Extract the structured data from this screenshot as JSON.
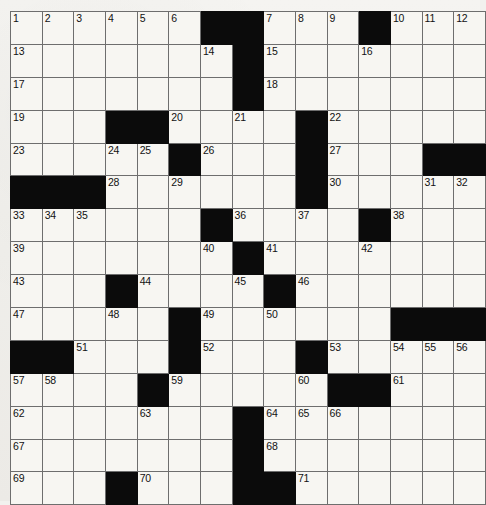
{
  "puzzle": {
    "type": "crossword-grid",
    "rows": 15,
    "cols": 15,
    "black_color": "#0b0b0b",
    "cell_color": "#f7f6f2",
    "grid_line_color": "#6e6e6e",
    "border_color": "#3a3a3a",
    "page_background": "#f2f1ee",
    "highest_number": 71,
    "black_cells": [
      [
        1,
        7
      ],
      [
        1,
        8
      ],
      [
        1,
        12
      ],
      [
        2,
        8
      ],
      [
        3,
        8
      ],
      [
        4,
        4
      ],
      [
        4,
        5
      ],
      [
        4,
        10
      ],
      [
        5,
        6
      ],
      [
        5,
        10
      ],
      [
        5,
        14
      ],
      [
        5,
        15
      ],
      [
        6,
        1
      ],
      [
        6,
        2
      ],
      [
        6,
        3
      ],
      [
        6,
        10
      ],
      [
        7,
        7
      ],
      [
        7,
        12
      ],
      [
        8,
        8
      ],
      [
        9,
        4
      ],
      [
        9,
        9
      ],
      [
        10,
        6
      ],
      [
        10,
        13
      ],
      [
        10,
        14
      ],
      [
        10,
        15
      ],
      [
        11,
        1
      ],
      [
        11,
        2
      ],
      [
        11,
        6
      ],
      [
        11,
        10
      ],
      [
        12,
        5
      ],
      [
        12,
        11
      ],
      [
        12,
        12
      ],
      [
        13,
        8
      ],
      [
        14,
        8
      ],
      [
        15,
        4
      ],
      [
        15,
        8
      ],
      [
        15,
        9
      ]
    ],
    "numbers": [
      {
        "row": 1,
        "col": 1,
        "n": "1"
      },
      {
        "row": 1,
        "col": 2,
        "n": "2"
      },
      {
        "row": 1,
        "col": 3,
        "n": "3"
      },
      {
        "row": 1,
        "col": 4,
        "n": "4"
      },
      {
        "row": 1,
        "col": 5,
        "n": "5"
      },
      {
        "row": 1,
        "col": 6,
        "n": "6"
      },
      {
        "row": 1,
        "col": 9,
        "n": "7"
      },
      {
        "row": 1,
        "col": 10,
        "n": "8"
      },
      {
        "row": 1,
        "col": 11,
        "n": "9"
      },
      {
        "row": 1,
        "col": 13,
        "n": "10"
      },
      {
        "row": 1,
        "col": 14,
        "n": "11"
      },
      {
        "row": 1,
        "col": 15,
        "n": "12"
      },
      {
        "row": 2,
        "col": 1,
        "n": "13"
      },
      {
        "row": 2,
        "col": 7,
        "n": "14"
      },
      {
        "row": 2,
        "col": 9,
        "n": "15"
      },
      {
        "row": 2,
        "col": 12,
        "n": "16"
      },
      {
        "row": 3,
        "col": 1,
        "n": "17"
      },
      {
        "row": 3,
        "col": 9,
        "n": "18"
      },
      {
        "row": 4,
        "col": 1,
        "n": "19"
      },
      {
        "row": 4,
        "col": 6,
        "n": "20"
      },
      {
        "row": 4,
        "col": 8,
        "n": "21"
      },
      {
        "row": 4,
        "col": 11,
        "n": "22"
      },
      {
        "row": 5,
        "col": 1,
        "n": "23"
      },
      {
        "row": 5,
        "col": 4,
        "n": "24"
      },
      {
        "row": 5,
        "col": 5,
        "n": "25"
      },
      {
        "row": 5,
        "col": 7,
        "n": "26"
      },
      {
        "row": 5,
        "col": 11,
        "n": "27"
      },
      {
        "row": 6,
        "col": 4,
        "n": "28"
      },
      {
        "row": 6,
        "col": 6,
        "n": "29"
      },
      {
        "row": 6,
        "col": 11,
        "n": "30"
      },
      {
        "row": 6,
        "col": 14,
        "n": "31"
      },
      {
        "row": 6,
        "col": 15,
        "n": "32"
      },
      {
        "row": 7,
        "col": 1,
        "n": "33"
      },
      {
        "row": 7,
        "col": 2,
        "n": "34"
      },
      {
        "row": 7,
        "col": 3,
        "n": "35"
      },
      {
        "row": 7,
        "col": 8,
        "n": "36"
      },
      {
        "row": 7,
        "col": 10,
        "n": "37"
      },
      {
        "row": 7,
        "col": 13,
        "n": "38"
      },
      {
        "row": 8,
        "col": 1,
        "n": "39"
      },
      {
        "row": 8,
        "col": 7,
        "n": "40"
      },
      {
        "row": 8,
        "col": 9,
        "n": "41"
      },
      {
        "row": 8,
        "col": 12,
        "n": "42"
      },
      {
        "row": 9,
        "col": 1,
        "n": "43"
      },
      {
        "row": 9,
        "col": 5,
        "n": "44"
      },
      {
        "row": 9,
        "col": 8,
        "n": "45"
      },
      {
        "row": 9,
        "col": 10,
        "n": "46"
      },
      {
        "row": 10,
        "col": 1,
        "n": "47"
      },
      {
        "row": 10,
        "col": 4,
        "n": "48"
      },
      {
        "row": 10,
        "col": 7,
        "n": "49"
      },
      {
        "row": 10,
        "col": 9,
        "n": "50"
      },
      {
        "row": 11,
        "col": 3,
        "n": "51"
      },
      {
        "row": 11,
        "col": 7,
        "n": "52"
      },
      {
        "row": 11,
        "col": 11,
        "n": "53"
      },
      {
        "row": 11,
        "col": 13,
        "n": "54"
      },
      {
        "row": 11,
        "col": 14,
        "n": "55"
      },
      {
        "row": 11,
        "col": 15,
        "n": "56"
      },
      {
        "row": 12,
        "col": 1,
        "n": "57"
      },
      {
        "row": 12,
        "col": 2,
        "n": "58"
      },
      {
        "row": 12,
        "col": 6,
        "n": "59"
      },
      {
        "row": 12,
        "col": 10,
        "n": "60"
      },
      {
        "row": 12,
        "col": 13,
        "n": "61"
      },
      {
        "row": 13,
        "col": 1,
        "n": "62"
      },
      {
        "row": 13,
        "col": 5,
        "n": "63"
      },
      {
        "row": 13,
        "col": 9,
        "n": "64"
      },
      {
        "row": 13,
        "col": 10,
        "n": "65"
      },
      {
        "row": 13,
        "col": 11,
        "n": "66"
      },
      {
        "row": 14,
        "col": 1,
        "n": "67"
      },
      {
        "row": 14,
        "col": 9,
        "n": "68"
      },
      {
        "row": 15,
        "col": 1,
        "n": "69"
      },
      {
        "row": 15,
        "col": 5,
        "n": "70"
      },
      {
        "row": 15,
        "col": 10,
        "n": "71"
      }
    ],
    "letters": []
  }
}
